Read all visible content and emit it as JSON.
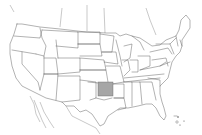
{
  "map": {
    "title": "",
    "region": "United States (contiguous) with neighboring Canada and Mexico outlines",
    "highlighted_region": {
      "name": "Oklahoma",
      "fill_color": "#a6a6a6"
    },
    "base_fill_color": "#ffffff",
    "border_color": "#555555",
    "labels": []
  }
}
